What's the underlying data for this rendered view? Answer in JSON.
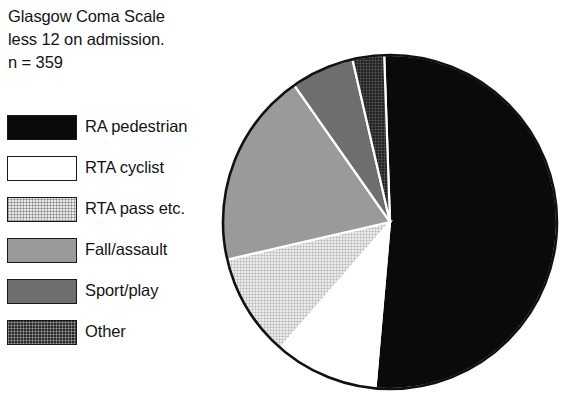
{
  "title": {
    "line1": "Glasgow Coma Scale",
    "line2": "less 12 on admission.",
    "line3": "n = 359"
  },
  "legend": {
    "items": [
      {
        "label": "RA pedestrian",
        "swatch": "solid-black",
        "color": "#0a0a0a"
      },
      {
        "label": "RTA cyclist",
        "swatch": "white",
        "color": "#ffffff"
      },
      {
        "label": "RTA pass etc.",
        "swatch": "light-hatch",
        "color": "#ebebeb"
      },
      {
        "label": "Fall/assault",
        "swatch": "mid-gray",
        "color": "#9a9a9a"
      },
      {
        "label": "Sport/play",
        "swatch": "dark-gray",
        "color": "#6e6e6e"
      },
      {
        "label": "Other",
        "swatch": "dark-hatch",
        "color": "#2a2a2a"
      }
    ]
  },
  "chart_data": {
    "type": "pie",
    "title": "Glasgow Coma Scale less 12 on admission.",
    "subtitle": "n = 359",
    "total": 359,
    "xlabel": "",
    "ylabel": "",
    "legend_position": "left",
    "grid": false,
    "start_angle_deg": 358,
    "direction": "clockwise",
    "categories": [
      "RA pedestrian",
      "RTA cyclist",
      "RTA pass etc.",
      "Fall/assault",
      "Sport/play",
      "Other"
    ],
    "values": [
      52,
      10,
      10,
      19,
      6,
      3
    ],
    "value_unit": "percent",
    "counts": [
      187,
      36,
      36,
      68,
      22,
      10
    ],
    "colors": [
      "#0a0a0a",
      "#ffffff",
      "#ebebeb",
      "#9a9a9a",
      "#6e6e6e",
      "#2a2a2a"
    ],
    "slice_angles_deg": [
      187,
      36,
      36,
      68,
      22,
      11
    ]
  },
  "geometry": {
    "center_x": 390,
    "center_y": 222,
    "radius": 167
  }
}
